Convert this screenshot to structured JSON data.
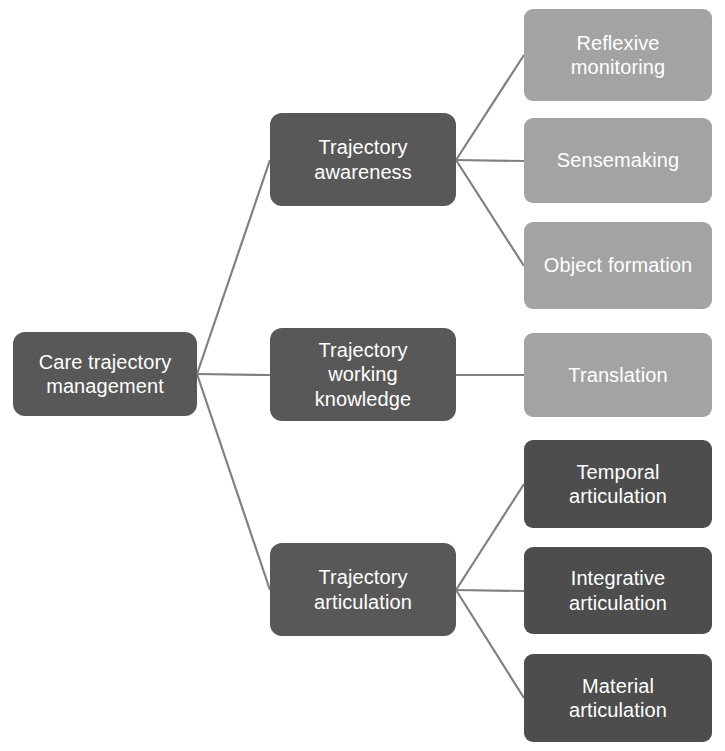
{
  "diagram": {
    "type": "hierarchy-tree",
    "orientation": "left-to-right",
    "colors": {
      "background": "#ffffff",
      "root_fill": "#585858",
      "mid_fill": "#585858",
      "leaf_dark_fill": "#4d4d4d",
      "leaf_light_fill": "#a3a3a3",
      "connector": "#808080",
      "text": "#ffffff"
    },
    "root": {
      "id": "care-trajectory-management",
      "label": "Care trajectory\nmanagement",
      "tone": "dark",
      "x": 13,
      "y": 332,
      "w": 184,
      "h": 84
    },
    "branches": [
      {
        "id": "trajectory-awareness",
        "label": "Trajectory\nawareness",
        "tone": "dark",
        "x": 270,
        "y": 113,
        "w": 186,
        "h": 93,
        "children": [
          {
            "id": "reflexive-monitoring",
            "label": "Reflexive\nmonitoring",
            "tone": "light",
            "x": 524,
            "y": 9,
            "w": 188,
            "h": 92
          },
          {
            "id": "sensemaking",
            "label": "Sensemaking",
            "tone": "light",
            "x": 524,
            "y": 118,
            "w": 188,
            "h": 85
          },
          {
            "id": "object-formation",
            "label": "Object formation",
            "tone": "light",
            "x": 524,
            "y": 222,
            "w": 188,
            "h": 87
          }
        ]
      },
      {
        "id": "trajectory-working-knowledge",
        "label": "Trajectory\nworking\nknowledge",
        "tone": "dark",
        "x": 270,
        "y": 328,
        "w": 186,
        "h": 93,
        "children": [
          {
            "id": "translation",
            "label": "Translation",
            "tone": "light",
            "x": 524,
            "y": 333,
            "w": 188,
            "h": 84
          }
        ]
      },
      {
        "id": "trajectory-articulation",
        "label": "Trajectory\narticulation",
        "tone": "dark",
        "x": 270,
        "y": 543,
        "w": 186,
        "h": 93,
        "children": [
          {
            "id": "temporal-articulation",
            "label": "Temporal\narticulation",
            "tone": "dark",
            "x": 524,
            "y": 440,
            "w": 188,
            "h": 88
          },
          {
            "id": "integrative-articulation",
            "label": "Integrative\narticulation",
            "tone": "dark",
            "x": 524,
            "y": 547,
            "w": 188,
            "h": 87
          },
          {
            "id": "material-articulation",
            "label": "Material\narticulation",
            "tone": "dark",
            "x": 524,
            "y": 654,
            "w": 188,
            "h": 88
          }
        ]
      }
    ],
    "connectors": [
      {
        "id": "root-to-trajectory-awareness",
        "x1": 197,
        "y1": 374,
        "x2": 270,
        "y2": 160
      },
      {
        "id": "root-to-trajectory-working-knowledge",
        "x1": 197,
        "y1": 374,
        "x2": 270,
        "y2": 375
      },
      {
        "id": "root-to-trajectory-articulation",
        "x1": 197,
        "y1": 374,
        "x2": 270,
        "y2": 590
      },
      {
        "id": "awareness-to-reflexive-monitoring",
        "x1": 456,
        "y1": 160,
        "x2": 524,
        "y2": 55
      },
      {
        "id": "awareness-to-sensemaking",
        "x1": 456,
        "y1": 160,
        "x2": 524,
        "y2": 161
      },
      {
        "id": "awareness-to-object-formation",
        "x1": 456,
        "y1": 160,
        "x2": 524,
        "y2": 266
      },
      {
        "id": "working-knowledge-to-translation",
        "x1": 456,
        "y1": 375,
        "x2": 524,
        "y2": 375
      },
      {
        "id": "articulation-to-temporal-articulation",
        "x1": 456,
        "y1": 590,
        "x2": 524,
        "y2": 484
      },
      {
        "id": "articulation-to-integrative-articulation",
        "x1": 456,
        "y1": 590,
        "x2": 524,
        "y2": 591
      },
      {
        "id": "articulation-to-material-articulation",
        "x1": 456,
        "y1": 590,
        "x2": 524,
        "y2": 698
      }
    ]
  }
}
